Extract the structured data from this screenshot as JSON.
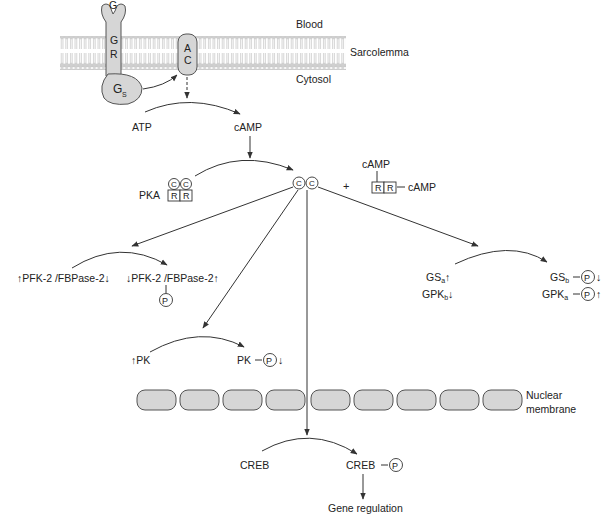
{
  "membrane": {
    "blood_label": "Blood",
    "sarcolemma_label": "Sarcolemma",
    "cytosol_label": "Cytosol",
    "ligand": "G",
    "receptor": [
      "G",
      "R"
    ],
    "g_protein": "G",
    "g_protein_sub": "S",
    "adenylyl_cyclase": [
      "A",
      "C"
    ]
  },
  "camp_step": {
    "substrate": "ATP",
    "product": "cAMP"
  },
  "pka_activation": {
    "pka_label": "PKA",
    "catalytic": "C",
    "regulatory": "R",
    "plus": "+",
    "camp_top": "cAMP",
    "camp_side": "cAMP"
  },
  "pfk_branch": {
    "left": {
      "pre_arrow": "↑",
      "text": "PFK-2 /FBPase-2",
      "post_arrow": "↓"
    },
    "right": {
      "pre_arrow": "↓",
      "text": "PFK-2 /FBPase-2",
      "post_arrow": "↑"
    },
    "phosphate": "P"
  },
  "pk_branch": {
    "left": {
      "pre_arrow": "↑",
      "text": "PK"
    },
    "right": {
      "text": "PK",
      "phosphate": "P",
      "post_arrow": "↓"
    }
  },
  "glycogen_branch": {
    "left": [
      {
        "main": "GS",
        "sub": "a",
        "arrow": "↑"
      },
      {
        "main": "GPK",
        "sub": "b",
        "arrow": "↓"
      }
    ],
    "right": [
      {
        "main": "GS",
        "sub": "b",
        "phosphate": "P",
        "arrow": "↓"
      },
      {
        "main": "GPK",
        "sub": "a",
        "phosphate": "P",
        "arrow": "↑"
      }
    ]
  },
  "nucleus": {
    "label_line1": "Nuclear",
    "label_line2": "membrane",
    "segment_count": 9
  },
  "creb_branch": {
    "left": "CREB",
    "right": "CREB",
    "phosphate": "P",
    "outcome": "Gene regulation"
  },
  "colors": {
    "membrane_gray": "#d9d9d9",
    "protein_fill": "#d6d6d6",
    "line": "#333333"
  }
}
